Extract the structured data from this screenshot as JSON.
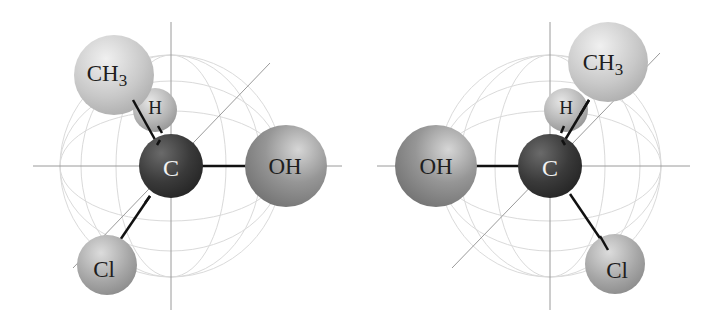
{
  "diagram": {
    "type": "molecular-3d-model",
    "colors": {
      "carbon": "#3a3a3a",
      "oh": "#8c8c8c",
      "ch3": "#c8c8c8",
      "h": "#b0b0b0",
      "cl": "#a6a6a6",
      "axis": "#9a9a9a",
      "globe": "#d8d8d8",
      "bond": "#111111"
    },
    "left": {
      "carbon": "C",
      "groups": {
        "top_left": "CH",
        "top_left_sub": "3",
        "back": "H",
        "right": "OH",
        "bottom_left": "Cl"
      }
    },
    "right": {
      "carbon": "C",
      "groups": {
        "top_right": "CH",
        "top_right_sub": "3",
        "back": "H",
        "left": "OH",
        "bottom_right": "Cl"
      }
    }
  }
}
